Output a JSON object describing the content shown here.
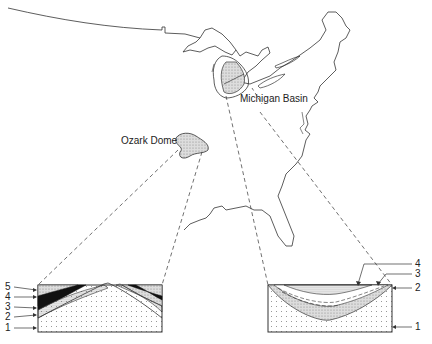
{
  "labels": {
    "michigan": "Michigan Basin",
    "ozark": "Ozark Dome"
  },
  "dome_section": {
    "layers": [
      "5",
      "4",
      "3",
      "2",
      "1"
    ]
  },
  "basin_section": {
    "layers": [
      "4",
      "3",
      "2",
      "1"
    ]
  },
  "colors": {
    "line": "#333333",
    "stipple": "#bbbbbb",
    "dark_layer": "#111111"
  }
}
